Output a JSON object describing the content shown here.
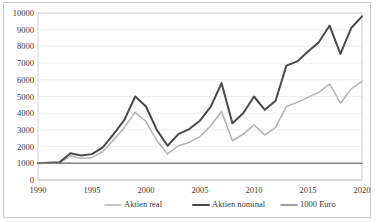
{
  "chart_data": {
    "type": "line",
    "title": "",
    "xlabel": "",
    "ylabel": "",
    "xlim": [
      1990,
      2020
    ],
    "ylim": [
      0,
      10000
    ],
    "grid": "horizontal",
    "legend_position": "bottom-center",
    "x_ticks": [
      "1990",
      "1995",
      "2000",
      "2005",
      "2010",
      "2015",
      "2020"
    ],
    "y_ticks": [
      "0",
      "1000",
      "2000",
      "3000",
      "4000",
      "5000",
      "6000",
      "7000",
      "8000",
      "9000",
      "10000"
    ],
    "x": [
      1990,
      1991,
      1992,
      1993,
      1994,
      1995,
      1996,
      1997,
      1998,
      1999,
      2000,
      2001,
      2002,
      2003,
      2004,
      2005,
      2006,
      2007,
      2008,
      2009,
      2010,
      2011,
      2012,
      2013,
      2014,
      2015,
      2016,
      2017,
      2018,
      2019,
      2020
    ],
    "series": [
      {
        "name": "Aktien real",
        "color": "#b3b3b3",
        "values": [
          1000,
          1010,
          1020,
          1450,
          1280,
          1350,
          1700,
          2400,
          3150,
          4050,
          3500,
          2350,
          1560,
          2050,
          2250,
          2600,
          3250,
          4100,
          2350,
          2750,
          3300,
          2700,
          3150,
          4400,
          4650,
          4950,
          5250,
          5750,
          4600,
          5450,
          5900
        ]
      },
      {
        "name": "Aktien nominal",
        "color": "#4a4a4a",
        "values": [
          1000,
          1030,
          1060,
          1600,
          1470,
          1550,
          1950,
          2750,
          3600,
          5000,
          4400,
          3000,
          2050,
          2750,
          3050,
          3550,
          4400,
          5800,
          3400,
          4000,
          5000,
          4200,
          4750,
          6850,
          7100,
          7700,
          8250,
          9250,
          7550,
          9100,
          9800
        ]
      },
      {
        "name": "1000 Euro",
        "color": "#808080",
        "values": [
          1000,
          1000,
          1000,
          1000,
          1000,
          1000,
          1000,
          1000,
          1000,
          1000,
          1000,
          1000,
          1000,
          1000,
          1000,
          1000,
          1000,
          1000,
          1000,
          1000,
          1000,
          1000,
          1000,
          1000,
          1000,
          1000,
          1000,
          1000,
          1000,
          1000,
          1000
        ]
      }
    ]
  }
}
